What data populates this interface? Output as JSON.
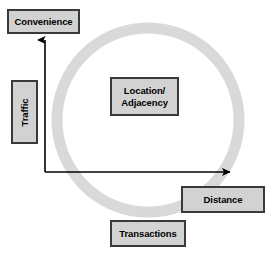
{
  "diagram": {
    "type": "concept-diagram",
    "ring": {
      "name": "cycle-ring",
      "color": "#d9d9d9",
      "center_x": 148,
      "center_y": 120,
      "radius_x": 91,
      "radius_y": 92,
      "stroke_width": 11
    },
    "axes": {
      "color": "#000000",
      "origin_x": 45,
      "origin_y": 172,
      "y_axis_tip_y": 34,
      "x_axis_tip_x": 236,
      "y_axis_label": "Traffic",
      "y_axis_head_label": "Convenience",
      "x_axis_head_label": "Distance"
    },
    "nodes": [
      {
        "id": "convenience",
        "label": "Convenience",
        "role": "y-axis-head",
        "fill": "#d2d2d2",
        "border": "#3a3a3a",
        "rotated": false
      },
      {
        "id": "traffic",
        "label": "Traffic",
        "role": "y-axis-title",
        "fill": "#d2d2d2",
        "border": "#3a3a3a",
        "rotated": true,
        "rotation_deg": -90
      },
      {
        "id": "location-adjacency",
        "label": "Location/\nAdjacency",
        "role": "center-concept",
        "fill": "#d2d2d2",
        "border": "#3a3a3a",
        "rotated": false
      },
      {
        "id": "distance",
        "label": "Distance",
        "role": "x-axis-head",
        "fill": "#d2d2d2",
        "border": "#3a3a3a",
        "rotated": false
      },
      {
        "id": "transactions",
        "label": "Transactions",
        "role": "bottom-concept",
        "fill": "#d2d2d2",
        "border": "#3a3a3a",
        "rotated": false
      }
    ]
  }
}
